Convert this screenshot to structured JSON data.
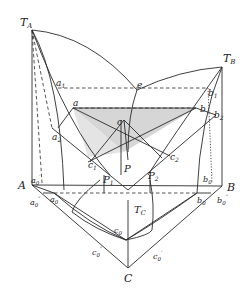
{
  "diagram": {
    "type": "ternary-eutectic-phase-diagram",
    "fill_color": "#d6d6d6",
    "line_color": "#2a2a2a",
    "labels": {
      "TA": "T",
      "TA_sub": "A",
      "TB": "T",
      "TB_sub": "B",
      "TC": "T",
      "TC_sub": "C",
      "A": "A",
      "B": "B",
      "C": "C",
      "e": "e",
      "a": "a",
      "a1": "a",
      "a1_sub": "1",
      "a2": "a",
      "a2_sub": "2",
      "b": "b",
      "b1": "b",
      "b1_sub": "1",
      "b2": "b",
      "b2_sub": "2",
      "c": "c",
      "c1": "c",
      "c1_sub": "1",
      "c2": "c",
      "c2_sub": "2",
      "P": "P",
      "P1": "P",
      "P1_sub": "1",
      "P2": "P",
      "P2_sub": "2",
      "a0": "a",
      "a0_sub": "0",
      "a0p": "a",
      "a0p_sub": "0",
      "a0p_sup": "′",
      "a0pp": "a",
      "a0pp_sub": "0",
      "a0pp_sup": "″",
      "b0": "b",
      "b0_sub": "0",
      "b0p": "b",
      "b0p_sub": "0",
      "b0p_sup": "′",
      "b0pp": "b",
      "b0pp_sub": "0",
      "b0pp_sup": "″",
      "c0": "c",
      "c0_sub": "0",
      "c0p": "c",
      "c0p_sub": "0",
      "c0p_sup": "′",
      "c0pp": "c",
      "c0pp_sub": "0",
      "c0pp_sup": "″"
    }
  }
}
